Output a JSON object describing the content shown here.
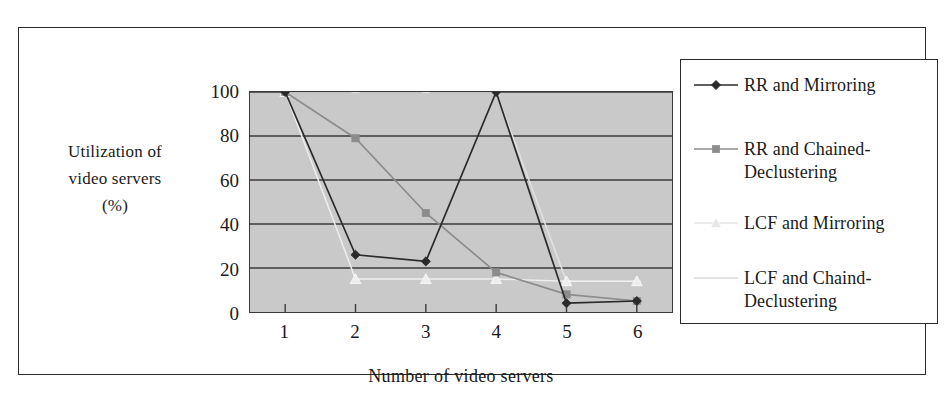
{
  "chart_data": {
    "type": "line",
    "title": "",
    "xlabel": "Number of video servers",
    "ylabel": "Utilization of video servers (%)",
    "ylabel_lines": [
      "Utilization of",
      "video servers",
      "(%)"
    ],
    "x": [
      1,
      2,
      3,
      4,
      5,
      6
    ],
    "xticklabels": [
      "1",
      "2",
      "3",
      "4",
      "5",
      "6"
    ],
    "yticklabels": [
      "100",
      "80",
      "60",
      "40",
      "20",
      "0"
    ],
    "yticks": [
      100,
      80,
      60,
      40,
      20,
      0
    ],
    "xlim": [
      0.5,
      6.5
    ],
    "ylim": [
      0,
      100
    ],
    "grid": "horizontal",
    "legend_position": "right-outside",
    "plot_background": "#c9c9c9",
    "series": [
      {
        "name": "RR and Mirroring",
        "marker": "diamond",
        "color": "#2a2a2a",
        "values": [
          100,
          26,
          23,
          100,
          4,
          5
        ]
      },
      {
        "name": "RR and Chained-Declustering",
        "marker": "square",
        "color": "#8c8c8c",
        "values": [
          100,
          79,
          45,
          18,
          8,
          5
        ]
      },
      {
        "name": "LCF and Mirroring",
        "marker": "triangle",
        "color": "#eeeeee",
        "values": [
          100,
          15,
          15,
          15,
          14,
          14
        ]
      },
      {
        "name": "LCF and Chaind-Declustering",
        "marker": "line",
        "color": "#e2e2e2",
        "values": [
          100,
          100,
          100,
          100,
          14,
          14
        ]
      }
    ]
  },
  "legend": {
    "entries": [
      {
        "label": "RR and Mirroring",
        "marker": "diamond",
        "color": "#2a2a2a"
      },
      {
        "label": "RR and Chained-\nDeclustering",
        "marker": "square",
        "color": "#8c8c8c"
      },
      {
        "label": "LCF and Mirroring",
        "marker": "triangle",
        "color": "#e6e6e6"
      },
      {
        "label": "LCF and Chaind-\nDeclustering",
        "marker": "line",
        "color": "#d8d8d8"
      }
    ]
  }
}
